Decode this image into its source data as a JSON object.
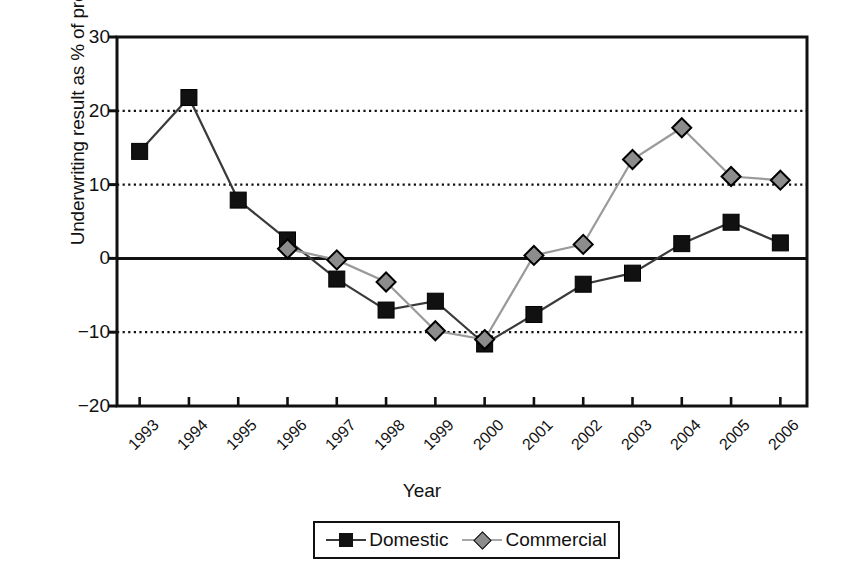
{
  "chart_data": {
    "type": "line",
    "title": "",
    "xlabel": "Year",
    "ylabel": "Underwriting result as % of premiums",
    "categories": [
      "1993",
      "1994",
      "1995",
      "1996",
      "1997",
      "1998",
      "1999",
      "2000",
      "2001",
      "2002",
      "2003",
      "2004",
      "2005",
      "2006"
    ],
    "yticks": [
      "30",
      "20",
      "10",
      "0",
      "-10",
      "-20"
    ],
    "ytick_values": [
      30,
      20,
      10,
      0,
      -10,
      -20
    ],
    "ylim": [
      -20,
      30
    ],
    "grid": "horizontal dotted at 20, 10, -10; solid baseline at 0",
    "legend_position": "bottom-center",
    "series": [
      {
        "name": "Domestic",
        "marker": "square",
        "marker_color": "#111111",
        "line_color": "#3a3a3a",
        "values": [
          14.5,
          21.8,
          7.9,
          2.5,
          -2.8,
          -7.0,
          -5.8,
          -11.6,
          -7.6,
          -3.5,
          -2.0,
          2.0,
          4.9,
          2.1
        ]
      },
      {
        "name": "Commercial",
        "marker": "diamond",
        "marker_color": "#8c8c8c",
        "line_color": "#9a9a9a",
        "values": [
          null,
          null,
          null,
          1.3,
          -0.2,
          -3.2,
          -9.8,
          -11.0,
          0.4,
          1.9,
          13.4,
          17.7,
          11.1,
          10.6
        ]
      }
    ]
  },
  "legend": {
    "items": [
      {
        "label": "Domestic",
        "marker": "square-marker-icon"
      },
      {
        "label": "Commercial",
        "marker": "diamond-marker-icon"
      }
    ]
  },
  "colors": {
    "axis": "#111111",
    "grid": "#111111",
    "domestic": "#111111",
    "commercial": "#8c8c8c",
    "background": "#ffffff"
  }
}
